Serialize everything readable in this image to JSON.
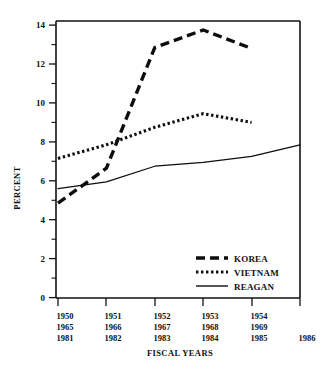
{
  "chart_data": {
    "type": "line",
    "title": "",
    "xlabel": "FISCAL YEARS",
    "ylabel": "PERCENT",
    "ylim": [
      0,
      14.6
    ],
    "ytick_labels": [
      "0",
      "2",
      "4",
      "6",
      "8",
      "10",
      "12",
      "14"
    ],
    "ytick_values": [
      0,
      2,
      4,
      6,
      8,
      10,
      12,
      14
    ],
    "yminor_values": [
      1,
      3,
      5,
      7,
      9,
      11,
      13
    ],
    "grid": false,
    "legend_position": "bottom-right",
    "x_positions": [
      0,
      1,
      2,
      3,
      4,
      5
    ],
    "xtick_rows": [
      [
        "1950",
        "1951",
        "1952",
        "1953",
        "1954",
        ""
      ],
      [
        "1965",
        "1966",
        "1967",
        "1968",
        "1969",
        ""
      ],
      [
        "1981",
        "1982",
        "1983",
        "1984",
        "1985",
        "1986"
      ]
    ],
    "series": [
      {
        "name": "KOREA",
        "style": "dashed-thick",
        "categories": [
          "1950",
          "1951",
          "1952",
          "1953",
          "1954"
        ],
        "x": [
          0,
          1,
          2,
          3,
          4
        ],
        "values": [
          4.85,
          6.65,
          12.85,
          13.75,
          12.8
        ]
      },
      {
        "name": "VIETNAM",
        "style": "dotted",
        "categories": [
          "1965",
          "1966",
          "1967",
          "1968",
          "1969"
        ],
        "x": [
          0,
          1,
          2,
          3,
          4
        ],
        "values": [
          7.15,
          7.85,
          8.75,
          9.45,
          9.0
        ]
      },
      {
        "name": "REAGAN",
        "style": "solid-thin",
        "categories": [
          "1981",
          "1982",
          "1983",
          "1984",
          "1985",
          "1986"
        ],
        "x": [
          0,
          1,
          2,
          3,
          4,
          5
        ],
        "values": [
          5.6,
          5.95,
          6.75,
          6.95,
          7.25,
          7.85
        ]
      }
    ],
    "legend": [
      {
        "label": "KOREA",
        "style": "dashed-thick"
      },
      {
        "label": "VIETNAM",
        "style": "dotted"
      },
      {
        "label": "REAGAN",
        "style": "solid-thin"
      }
    ],
    "colors": {
      "ink": "#0d0d0d",
      "background": "#ffffff"
    }
  }
}
